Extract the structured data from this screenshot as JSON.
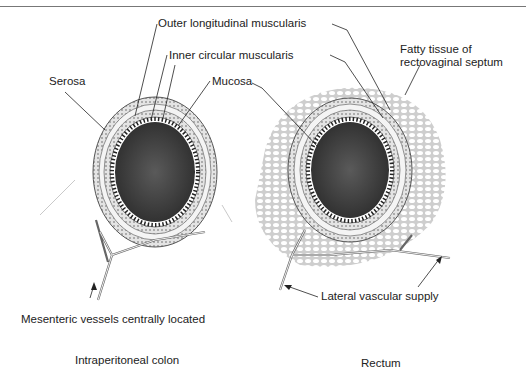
{
  "labels": {
    "outer_longitudinal": "Outer longitudinal muscularis",
    "inner_circular": "Inner circular muscularis",
    "serosa": "Serosa",
    "mucosa": "Mucosa",
    "fatty_tissue_line1": "Fatty tissue of",
    "fatty_tissue_line2": "rectovaginal septum",
    "mesenteric": "Mesenteric vessels centrally located",
    "lateral": "Lateral vascular supply"
  },
  "captions": {
    "left": "Intraperitoneal colon",
    "right": "Rectum"
  },
  "colors": {
    "lumen": "#3a3a3a",
    "tissue": "#d8d8d8",
    "line": "#222222"
  }
}
